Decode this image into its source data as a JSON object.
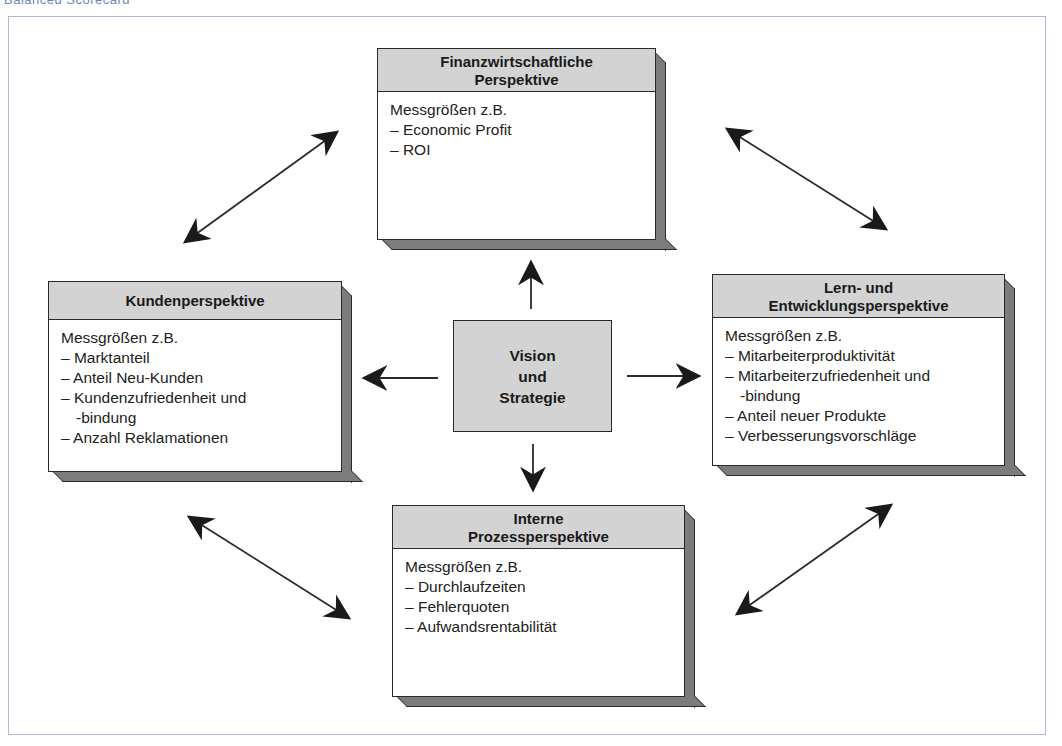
{
  "caption": "Balanced Scorecard",
  "colors": {
    "header_fill": "#d3d3d3",
    "depth_fill": "#7c7c7c",
    "outline": "#2a2a2a",
    "frame_border": "#a9b9d6"
  },
  "center": {
    "lines": [
      "Vision",
      "und",
      "Strategie"
    ]
  },
  "perspectives": {
    "financial": {
      "title_lines": [
        "Finanzwirtschaftliche",
        "Perspektive"
      ],
      "intro": "Messgrößen z.B.",
      "items": [
        "– Economic Profit",
        "– ROI"
      ]
    },
    "customer": {
      "title_lines": [
        "Kundenperspektive"
      ],
      "intro": "Messgrößen z.B.",
      "items": [
        "– Marktanteil",
        "– Anteil Neu-Kunden",
        "– Kundenzufriedenheit und",
        "-bindung",
        "– Anzahl Reklamationen"
      ]
    },
    "learning": {
      "title_lines": [
        "Lern- und",
        "Entwicklungsperspektive"
      ],
      "intro": "Messgrößen z.B.",
      "items": [
        "– Mitarbeiterproduktivität",
        "– Mitarbeiterzufriedenheit und",
        "-bindung",
        "– Anteil neuer Produkte",
        "– Verbesserungsvorschläge"
      ]
    },
    "process": {
      "title_lines": [
        "Interne",
        "Prozessperspektive"
      ],
      "intro": "Messgrößen z.B.",
      "items": [
        "– Durchlaufzeiten",
        "– Fehlerquoten",
        "– Aufwandsrentabilität"
      ]
    }
  },
  "arrows": {
    "center_to_top": "Vision und Strategie → Finanzwirtschaftliche Perspektive",
    "center_to_left": "Vision und Strategie → Kundenperspektive",
    "center_to_right": "Vision und Strategie → Lern- und Entwicklungsperspektive",
    "center_to_bottom": "Vision und Strategie → Interne Prozessperspektive",
    "top_left": "Finanzwirtschaftliche ↔ Kunden",
    "top_right": "Finanzwirtschaftliche ↔ Lern- und Entwicklung",
    "bottom_left": "Kunden ↔ Interne Prozesse",
    "bottom_right": "Interne Prozesse ↔ Lern- und Entwicklung"
  }
}
